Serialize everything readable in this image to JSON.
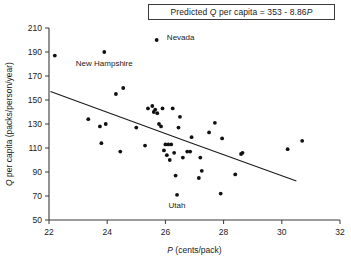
{
  "chart_data": {
    "type": "scatter",
    "title": "",
    "annotation_box": {
      "prefix": "Predicted ",
      "italic_q": "Q",
      "mid": " per capita = 353 - 8.86",
      "italic_p": "P"
    },
    "xlabel_italic": "P",
    "xlabel_rest": " (cents/pack)",
    "ylabel_italic": "Q",
    "ylabel_rest": " per capita (packs/person/year)",
    "xlim": [
      22,
      32
    ],
    "ylim": [
      50,
      210
    ],
    "xticks": [
      22,
      24,
      26,
      28,
      30,
      32
    ],
    "yticks": [
      50,
      70,
      90,
      110,
      130,
      150,
      170,
      190,
      210
    ],
    "grid": false,
    "legend": "none",
    "fit_line": {
      "intercept": 353,
      "slope": -8.86,
      "x_start": 22.05,
      "y_start": 157,
      "x_end": 26.65,
      "y_end": 116.2,
      "x_end2": 30.5,
      "y_end2": 82.5
    },
    "points": [
      {
        "x": 22.2,
        "y": 187
      },
      {
        "x": 23.35,
        "y": 134
      },
      {
        "x": 23.75,
        "y": 128
      },
      {
        "x": 23.8,
        "y": 114
      },
      {
        "x": 23.9,
        "y": 190,
        "label": "New Hampshire"
      },
      {
        "x": 23.95,
        "y": 130
      },
      {
        "x": 24.3,
        "y": 155
      },
      {
        "x": 24.45,
        "y": 107
      },
      {
        "x": 24.55,
        "y": 160
      },
      {
        "x": 25.0,
        "y": 127
      },
      {
        "x": 25.3,
        "y": 112
      },
      {
        "x": 25.4,
        "y": 143
      },
      {
        "x": 25.55,
        "y": 145
      },
      {
        "x": 25.6,
        "y": 140
      },
      {
        "x": 25.65,
        "y": 142
      },
      {
        "x": 25.7,
        "y": 200,
        "label": "Nevada"
      },
      {
        "x": 25.72,
        "y": 139
      },
      {
        "x": 25.78,
        "y": 130
      },
      {
        "x": 25.85,
        "y": 128
      },
      {
        "x": 25.9,
        "y": 143
      },
      {
        "x": 25.95,
        "y": 108
      },
      {
        "x": 26.0,
        "y": 113
      },
      {
        "x": 26.05,
        "y": 104
      },
      {
        "x": 26.1,
        "y": 113
      },
      {
        "x": 26.15,
        "y": 100
      },
      {
        "x": 26.2,
        "y": 113
      },
      {
        "x": 26.25,
        "y": 143
      },
      {
        "x": 26.3,
        "y": 106
      },
      {
        "x": 26.35,
        "y": 87
      },
      {
        "x": 26.4,
        "y": 71,
        "label": "Utah"
      },
      {
        "x": 26.45,
        "y": 127
      },
      {
        "x": 26.5,
        "y": 136
      },
      {
        "x": 26.6,
        "y": 102
      },
      {
        "x": 26.75,
        "y": 107
      },
      {
        "x": 26.85,
        "y": 107
      },
      {
        "x": 26.9,
        "y": 119
      },
      {
        "x": 27.15,
        "y": 85
      },
      {
        "x": 27.2,
        "y": 102
      },
      {
        "x": 27.25,
        "y": 91
      },
      {
        "x": 27.5,
        "y": 123
      },
      {
        "x": 27.7,
        "y": 131
      },
      {
        "x": 27.9,
        "y": 72
      },
      {
        "x": 27.95,
        "y": 118
      },
      {
        "x": 28.4,
        "y": 88
      },
      {
        "x": 28.6,
        "y": 105
      },
      {
        "x": 28.65,
        "y": 106
      },
      {
        "x": 30.2,
        "y": 109
      },
      {
        "x": 30.7,
        "y": 116
      }
    ],
    "point_labels": [
      {
        "text": "Nevada",
        "x": 26.05,
        "y": 200,
        "anchor": "start"
      },
      {
        "text": "New Hampshire",
        "x": 23.9,
        "y": 178,
        "anchor": "middle"
      },
      {
        "text": "Utah",
        "x": 26.4,
        "y": 60,
        "anchor": "middle"
      }
    ]
  }
}
